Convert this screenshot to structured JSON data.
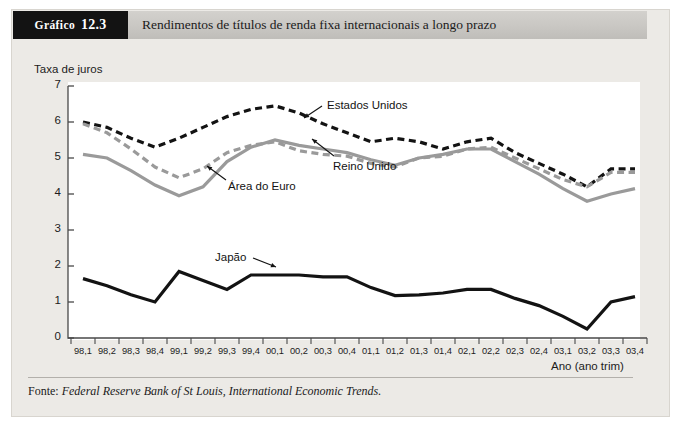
{
  "figure": {
    "tag_word": "Gráfico",
    "tag_number": "12.3",
    "title": "Rendimentos de títulos de renda fixa internacionais a longo prazo",
    "footer_prefix": "Fonte:",
    "footer_source": "Federal Reserve Bank of St Louis, International Economic Trends.",
    "panel_bg": "#eceae6",
    "header_bg": "#c9c7c3",
    "tag_bg": "#131313"
  },
  "chart_data": {
    "type": "line",
    "title": "Rendimentos de títulos de renda fixa internacionais a longo prazo",
    "xlabel": "Ano (ano trim)",
    "ylabel": "Taxa de juros",
    "ylim": [
      0,
      7
    ],
    "yticks": [
      "0",
      "1",
      "2",
      "3",
      "4",
      "5",
      "6",
      "7"
    ],
    "grid": false,
    "legend_position": "inline-annotations",
    "categories": [
      "98,1",
      "98,2",
      "98,3",
      "98,4",
      "99,1",
      "99,2",
      "99,3",
      "99,4",
      "00,1",
      "00,2",
      "00,3",
      "00,4",
      "01,1",
      "01,2",
      "01,3",
      "01,4",
      "02,1",
      "02,2",
      "02,3",
      "02,4",
      "03,1",
      "03,2",
      "03,3",
      "03,4"
    ],
    "series": [
      {
        "name": "Estados Unidos",
        "color": "#131313",
        "style": "dashed",
        "width": 3.2,
        "values": [
          6.0,
          5.85,
          5.55,
          5.3,
          5.55,
          5.85,
          6.15,
          6.35,
          6.45,
          6.25,
          5.95,
          5.7,
          5.45,
          5.55,
          5.45,
          5.25,
          5.45,
          5.55,
          5.15,
          4.85,
          4.55,
          4.2,
          4.7,
          4.7
        ]
      },
      {
        "name": "Reino Unido",
        "color": "#9a9a9a",
        "style": "dashed",
        "width": 3.2,
        "values": [
          5.95,
          5.7,
          5.25,
          4.75,
          4.45,
          4.7,
          5.15,
          5.35,
          5.45,
          5.2,
          5.1,
          5.05,
          4.85,
          4.75,
          5.0,
          5.05,
          5.25,
          5.3,
          5.0,
          4.7,
          4.4,
          4.2,
          4.6,
          4.6
        ]
      },
      {
        "name": "Área do Euro",
        "color": "#9a9a9a",
        "style": "solid",
        "width": 3.2,
        "values": [
          5.1,
          5.0,
          4.65,
          4.25,
          3.95,
          4.2,
          4.9,
          5.3,
          5.5,
          5.35,
          5.25,
          5.15,
          4.95,
          4.8,
          5.0,
          5.1,
          5.25,
          5.25,
          4.9,
          4.55,
          4.15,
          3.8,
          4.0,
          4.15
        ]
      },
      {
        "name": "Japão",
        "color": "#131313",
        "style": "solid",
        "width": 3.2,
        "values": [
          1.65,
          1.45,
          1.2,
          1.0,
          1.85,
          1.6,
          1.35,
          1.75,
          1.75,
          1.75,
          1.7,
          1.7,
          1.4,
          1.18,
          1.2,
          1.25,
          1.35,
          1.35,
          1.1,
          0.9,
          0.6,
          0.25,
          1.0,
          1.15
        ]
      }
    ],
    "annotations": [
      {
        "text": "Estados Unidos",
        "series": "Estados Unidos"
      },
      {
        "text": "Área do Euro",
        "series": "Área do Euro"
      },
      {
        "text": "Reino Unido",
        "series": "Reino Unido"
      },
      {
        "text": "Japão",
        "series": "Japão"
      }
    ]
  }
}
